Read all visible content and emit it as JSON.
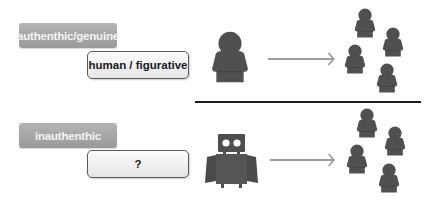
{
  "rows": [
    {
      "category_label": "authenthic/genuine",
      "source_label": "human / figurative",
      "source_icon": "person-icon",
      "arrow_icon": "arrow-right-icon",
      "audience_icon": "group-of-people-icon",
      "audience_count": 4
    },
    {
      "category_label": "inauthenthic",
      "source_label": "?",
      "source_icon": "robot-icon",
      "arrow_icon": "arrow-right-icon",
      "audience_icon": "group-of-people-icon",
      "audience_count": 4
    }
  ],
  "colors": {
    "icon_fill": "#555555",
    "label_dark_bg": "#a8a8a8",
    "label_dark_text": "#f4f4f4",
    "label_light_bg": "#f0f0f0",
    "label_light_border": "#5a5a5a",
    "arrow": "#9c9c9c",
    "divider": "#1e1e1e"
  }
}
